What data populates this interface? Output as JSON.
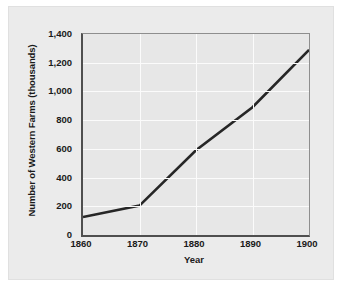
{
  "chart_data": {
    "type": "line",
    "title": "",
    "xlabel": "Year",
    "ylabel": "Number of Western Farms (thousands)",
    "x": [
      1860,
      1870,
      1880,
      1890,
      1900
    ],
    "values": [
      125,
      205,
      590,
      890,
      1290
    ],
    "xticklabels": [
      "1860",
      "1870",
      "1880",
      "1890",
      "1900"
    ],
    "yticklabels": [
      "0",
      "200",
      "400",
      "600",
      "800",
      "1,000",
      "1,200",
      "1,400"
    ],
    "ytickvalues": [
      0,
      200,
      400,
      600,
      800,
      1000,
      1200,
      1400
    ],
    "xlim": [
      1860,
      1900
    ],
    "ylim": [
      0,
      1400
    ],
    "grid": true,
    "legend": false,
    "series": [
      {
        "name": "Number of Western Farms (thousands)",
        "values": [
          125,
          205,
          590,
          890,
          1290
        ],
        "color": "#262626"
      }
    ]
  },
  "colors": {
    "card_background": "#ebebeb",
    "plot_background": "#e7e7e7",
    "gridline": "#fbfbfb",
    "axis": "#4f4f4f",
    "line": "#262626",
    "text": "#1a1a1a"
  }
}
